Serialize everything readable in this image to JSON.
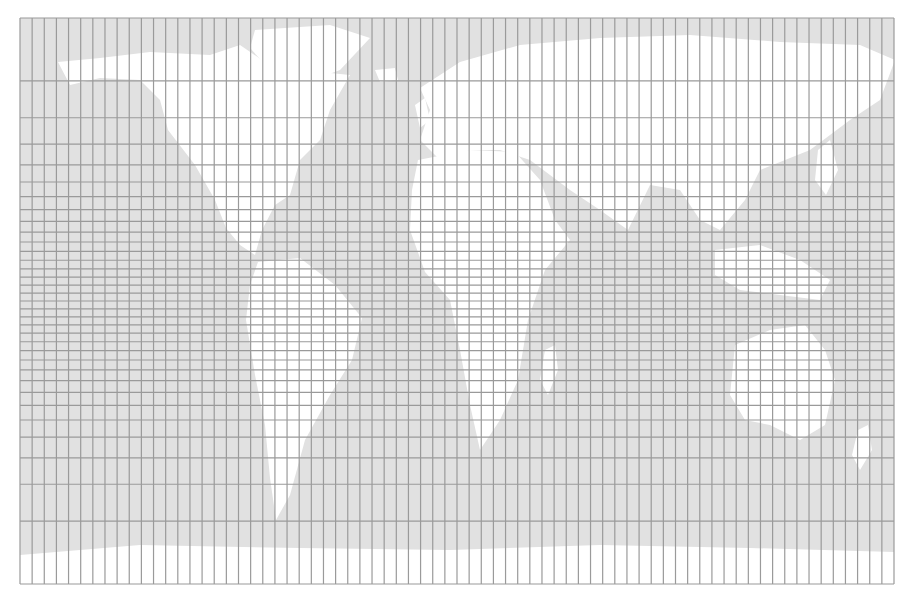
{
  "map": {
    "projection": "Mercator",
    "frame": {
      "left": 20,
      "top": 18,
      "right": 894,
      "bottom": 584
    },
    "colors": {
      "background": "#ffffff",
      "ocean": "#e1e1e1",
      "land": "#ffffff",
      "grid": "#9a9a9a"
    },
    "graticule": {
      "lon_step_deg": 5,
      "lat_step_deg": 5,
      "lon_range": [
        -180,
        180
      ],
      "lat_range": [
        -85,
        85
      ],
      "grid_line_width": 1.2
    },
    "landmasses": [
      {
        "name": "north-america",
        "points": [
          [
            58,
            62
          ],
          [
            100,
            58
          ],
          [
            150,
            52
          ],
          [
            210,
            55
          ],
          [
            240,
            45
          ],
          [
            262,
            60
          ],
          [
            300,
            70
          ],
          [
            350,
            75
          ],
          [
            330,
            110
          ],
          [
            320,
            140
          ],
          [
            300,
            160
          ],
          [
            290,
            195
          ],
          [
            275,
            205
          ],
          [
            262,
            230
          ],
          [
            255,
            255
          ],
          [
            240,
            245
          ],
          [
            226,
            228
          ],
          [
            215,
            200
          ],
          [
            195,
            165
          ],
          [
            168,
            130
          ],
          [
            160,
            100
          ],
          [
            140,
            80
          ],
          [
            100,
            78
          ],
          [
            70,
            85
          ]
        ]
      },
      {
        "name": "greenland",
        "points": [
          [
            255,
            30
          ],
          [
            330,
            25
          ],
          [
            370,
            38
          ],
          [
            340,
            70
          ],
          [
            300,
            85
          ],
          [
            270,
            70
          ],
          [
            250,
            48
          ]
        ]
      },
      {
        "name": "south-america",
        "points": [
          [
            258,
            262
          ],
          [
            300,
            258
          ],
          [
            335,
            285
          ],
          [
            362,
            318
          ],
          [
            352,
            360
          ],
          [
            330,
            395
          ],
          [
            305,
            440
          ],
          [
            290,
            495
          ],
          [
            276,
            520
          ],
          [
            270,
            478
          ],
          [
            265,
            425
          ],
          [
            255,
            375
          ],
          [
            246,
            320
          ],
          [
            250,
            285
          ]
        ]
      },
      {
        "name": "eurasia",
        "points": [
          [
            420,
            88
          ],
          [
            460,
            62
          ],
          [
            520,
            45
          ],
          [
            600,
            38
          ],
          [
            690,
            35
          ],
          [
            780,
            42
          ],
          [
            860,
            45
          ],
          [
            895,
            60
          ],
          [
            880,
            100
          ],
          [
            850,
            120
          ],
          [
            810,
            150
          ],
          [
            760,
            170
          ],
          [
            745,
            200
          ],
          [
            720,
            230
          ],
          [
            700,
            220
          ],
          [
            680,
            190
          ],
          [
            650,
            185
          ],
          [
            628,
            230
          ],
          [
            600,
            210
          ],
          [
            570,
            190
          ],
          [
            530,
            160
          ],
          [
            500,
            150
          ],
          [
            470,
            150
          ],
          [
            440,
            160
          ],
          [
            420,
            140
          ],
          [
            430,
            110
          ]
        ]
      },
      {
        "name": "africa",
        "points": [
          [
            418,
            160
          ],
          [
            470,
            150
          ],
          [
            515,
            152
          ],
          [
            540,
            180
          ],
          [
            555,
            220
          ],
          [
            570,
            240
          ],
          [
            545,
            270
          ],
          [
            528,
            320
          ],
          [
            518,
            380
          ],
          [
            500,
            420
          ],
          [
            480,
            450
          ],
          [
            470,
            405
          ],
          [
            460,
            350
          ],
          [
            450,
            300
          ],
          [
            425,
            272
          ],
          [
            410,
            230
          ],
          [
            412,
            190
          ]
        ]
      },
      {
        "name": "madagascar",
        "points": [
          [
            545,
            350
          ],
          [
            555,
            345
          ],
          [
            558,
            370
          ],
          [
            548,
            395
          ],
          [
            540,
            380
          ]
        ]
      },
      {
        "name": "southeast-asia-islands",
        "points": [
          [
            715,
            250
          ],
          [
            760,
            245
          ],
          [
            800,
            260
          ],
          [
            830,
            280
          ],
          [
            820,
            300
          ],
          [
            780,
            295
          ],
          [
            740,
            290
          ],
          [
            715,
            275
          ]
        ]
      },
      {
        "name": "japan",
        "points": [
          [
            818,
            150
          ],
          [
            830,
            140
          ],
          [
            838,
            170
          ],
          [
            826,
            195
          ],
          [
            815,
            180
          ]
        ]
      },
      {
        "name": "australia",
        "points": [
          [
            735,
            345
          ],
          [
            770,
            330
          ],
          [
            805,
            325
          ],
          [
            825,
            350
          ],
          [
            835,
            380
          ],
          [
            825,
            425
          ],
          [
            800,
            440
          ],
          [
            770,
            425
          ],
          [
            745,
            420
          ],
          [
            730,
            395
          ]
        ]
      },
      {
        "name": "new-zealand",
        "points": [
          [
            858,
            430
          ],
          [
            868,
            425
          ],
          [
            872,
            450
          ],
          [
            860,
            470
          ],
          [
            852,
            455
          ]
        ]
      },
      {
        "name": "antarctica",
        "points": [
          [
            20,
            555
          ],
          [
            140,
            545
          ],
          [
            300,
            548
          ],
          [
            450,
            550
          ],
          [
            600,
            545
          ],
          [
            750,
            548
          ],
          [
            894,
            552
          ],
          [
            894,
            584
          ],
          [
            20,
            584
          ]
        ]
      },
      {
        "name": "uk-ireland",
        "points": [
          [
            415,
            105
          ],
          [
            425,
            98
          ],
          [
            430,
            120
          ],
          [
            420,
            128
          ]
        ]
      },
      {
        "name": "iceland",
        "points": [
          [
            375,
            70
          ],
          [
            395,
            68
          ],
          [
            398,
            80
          ],
          [
            380,
            82
          ]
        ]
      }
    ]
  }
}
